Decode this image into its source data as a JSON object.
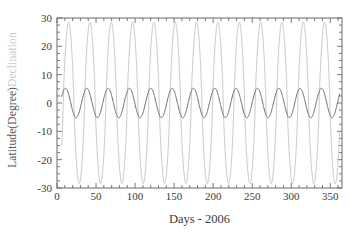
{
  "chart_data": {
    "type": "line",
    "title": "",
    "xlabel": "Days - 2006",
    "ylabel_primary": "Latitude(Degree)",
    "ylabel_secondary": "Declination",
    "xlim": [
      0,
      365
    ],
    "ylim": [
      -30,
      30
    ],
    "grid": false,
    "legend": "none",
    "x_ticks": [
      0,
      50,
      100,
      150,
      200,
      250,
      300,
      350
    ],
    "x_tick_labels": [
      "0",
      "50",
      "100",
      "150",
      "200",
      "250",
      "300",
      "350"
    ],
    "x_minor_tick_step": 10,
    "y_ticks": [
      30,
      20,
      10,
      0,
      -10,
      -20,
      -30
    ],
    "y_tick_labels": [
      "30",
      "20",
      "10",
      "0",
      "-10",
      "-20",
      "-30"
    ],
    "y_minor_tick_step": 2.5,
    "series": [
      {
        "name": "Declination",
        "color": "#c5c5c7",
        "amplitude": 28.5,
        "period_days": 27.32,
        "phase_days": 8.0,
        "mean": 0,
        "x_start": 6,
        "x_end": 362,
        "linewidth": 0.9,
        "waveform": "sine-sharpened",
        "peak_value": 28.5,
        "trough_value": -28.5,
        "n_cycles": 13
      },
      {
        "name": "Latitude(Degree)",
        "color": "#6d6d70",
        "amplitude": 5.2,
        "period_days": 27.32,
        "phase_days": 4.0,
        "mean": 0,
        "x_start": 6,
        "x_end": 362,
        "linewidth": 1.0,
        "waveform": "sine",
        "peak_value": 5.2,
        "trough_value": -5.2,
        "n_cycles": 13
      }
    ]
  },
  "axes": {
    "frame_color": "#6a6a6c",
    "background": "#ffffff"
  }
}
